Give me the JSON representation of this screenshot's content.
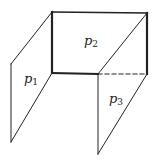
{
  "diagram": {
    "colors": {
      "line": "#222222",
      "background": "#ffffff"
    },
    "planes": [
      {
        "id": "p1",
        "letter": "p",
        "subscript": "1",
        "vertices": [
          [
            52,
            12
          ],
          [
            52,
            73
          ],
          [
            11,
            142
          ],
          [
            11,
            64
          ]
        ]
      },
      {
        "id": "p2",
        "letter": "p",
        "subscript": "2",
        "vertices": [
          [
            52,
            12
          ],
          [
            147,
            13
          ],
          [
            147,
            74
          ],
          [
            52,
            73
          ]
        ]
      },
      {
        "id": "p3",
        "letter": "p",
        "subscript": "3",
        "vertices": [
          [
            147,
            13
          ],
          [
            147,
            74
          ],
          [
            98,
            154
          ],
          [
            98,
            74
          ]
        ]
      }
    ],
    "labels": {
      "p1": {
        "letter": "p",
        "sub": "1"
      },
      "p2": {
        "letter": "p",
        "sub": "2"
      },
      "p3": {
        "letter": "p",
        "sub": "3"
      }
    }
  }
}
